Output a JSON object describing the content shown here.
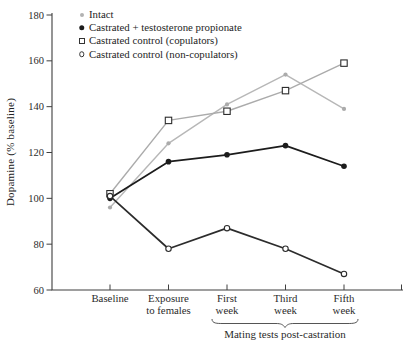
{
  "figure": {
    "ylabel": "Dopamine (% baseline)",
    "annotation_label": "Mating tests post-castration"
  },
  "chart_data": {
    "type": "line",
    "title": "",
    "xlabel": "",
    "ylabel": "Dopamine (% baseline)",
    "ylim": [
      60,
      180
    ],
    "yticks": [
      180,
      160,
      140,
      120,
      100,
      80,
      60
    ],
    "grid": false,
    "legend_position": "top-left",
    "categories": [
      "Baseline",
      "Exposure\nto females",
      "First\nweek",
      "Third\nweek",
      "Fifth\nweek"
    ],
    "annotation": {
      "text": "Mating tests post-castration",
      "span_categories": [
        "First week",
        "Fifth week"
      ]
    },
    "series": [
      {
        "name": "Intact",
        "marker": "gray-dot",
        "line_color": "#b7b7b7",
        "marker_color": "#ababab",
        "values": [
          96,
          124,
          141,
          154,
          139
        ]
      },
      {
        "name": "Castrated + testosterone propionate",
        "marker": "filled-circle",
        "line_color": "#1c1c1c",
        "marker_color": "#1c1c1c",
        "values": [
          100,
          116,
          119,
          123,
          114
        ]
      },
      {
        "name": "Castrated control (copulators)",
        "marker": "open-square",
        "line_color": "#ababab",
        "marker_color": "#2c2c2c",
        "values": [
          102,
          134,
          138,
          147,
          159
        ]
      },
      {
        "name": "Castrated control (non-copulators)",
        "marker": "open-circle",
        "line_color": "#2c2c2c",
        "marker_color": "#2c2c2c",
        "values": [
          101,
          78,
          87,
          78,
          67
        ]
      }
    ]
  }
}
